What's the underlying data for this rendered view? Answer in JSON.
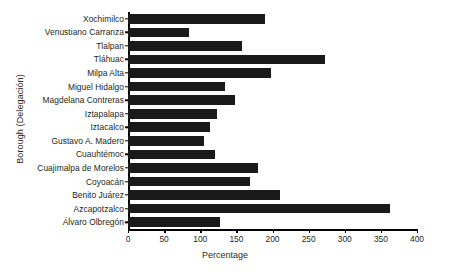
{
  "chart_data": {
    "type": "bar",
    "orientation": "horizontal",
    "title": "",
    "xlabel": "Percentage",
    "ylabel": "Borough (Delegación)",
    "xlim": [
      0,
      400
    ],
    "xticks": [
      0,
      50,
      100,
      150,
      200,
      250,
      300,
      350,
      400
    ],
    "grid": false,
    "legend": null,
    "bar_color": "#1a1a1a",
    "categories": [
      "Xochimilco",
      "Venustiano Carranza",
      "Tlalpan",
      "Tláhuac",
      "Milpa Alta",
      "Miguel Hidalgo",
      "Magdelana Contreras",
      "Iztapalapa",
      "Iztacalco",
      "Gustavo A. Madero",
      "Cuauhtémoc",
      "Cuajimalpa de Morelos",
      "Coyoacán",
      "Benito Juárez",
      "Azcapotzalco",
      "Álvaro Olbregón"
    ],
    "values": [
      190,
      84,
      158,
      272,
      198,
      134,
      148,
      123,
      113,
      105,
      120,
      180,
      169,
      210,
      363,
      127
    ],
    "series": [
      {
        "name": "Percentage",
        "values": [
          190,
          84,
          158,
          272,
          198,
          134,
          148,
          123,
          113,
          105,
          120,
          180,
          169,
          210,
          363,
          127
        ]
      }
    ]
  }
}
